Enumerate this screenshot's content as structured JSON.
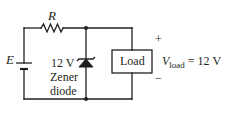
{
  "diagram": {
    "type": "circuit-schematic",
    "colors": {
      "wire": "#231f20",
      "background": "#ffffff"
    },
    "components": {
      "source": {
        "label": "E",
        "symbol": "battery-icon"
      },
      "resistor": {
        "label": "R",
        "symbol": "resistor-icon"
      },
      "zener": {
        "voltage_label": "12 V",
        "name_line1": "Zener",
        "name_line2": "diode",
        "symbol": "zener-diode-icon"
      },
      "load": {
        "label": "Load",
        "symbol": "load-box"
      }
    },
    "output": {
      "plus": "+",
      "minus": "−",
      "voltage_symbol": "V",
      "voltage_subscript": "load",
      "voltage_value": "= 12 V"
    }
  }
}
